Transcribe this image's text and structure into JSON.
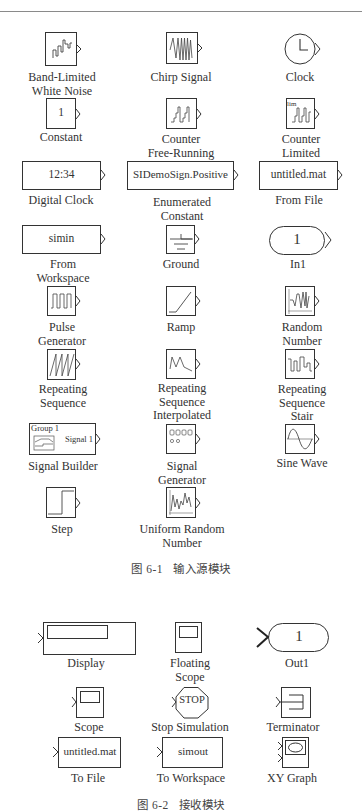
{
  "figure1": {
    "caption_number": "图 6-1",
    "caption_text": "输入源模块",
    "blocks": [
      {
        "name": "Band-Limited White Noise",
        "label": [
          "Band-Limited",
          "White Noise"
        ],
        "icon": "band-limited-noise-icon"
      },
      {
        "name": "Chirp Signal",
        "label": [
          "Chirp Signal"
        ],
        "icon": "chirp-icon"
      },
      {
        "name": "Clock",
        "label": [
          "Clock"
        ],
        "icon": "clock-icon"
      },
      {
        "name": "Constant",
        "label": [
          "Constant"
        ],
        "icon": "constant-icon",
        "value": "1"
      },
      {
        "name": "Counter Free-Running",
        "label": [
          "Counter",
          "Free-Running"
        ],
        "icon": "counter-icon"
      },
      {
        "name": "Counter Limited",
        "label": [
          "Counter",
          "Limited"
        ],
        "icon": "counter-limited-icon",
        "tag": "lim"
      },
      {
        "name": "Digital Clock",
        "label": [
          "Digital Clock"
        ],
        "icon": "digital-clock-icon",
        "value": "12:34"
      },
      {
        "name": "Enumerated Constant",
        "label": [
          "Enumerated",
          "Constant"
        ],
        "icon": "enum-constant-icon",
        "value": "SIDemoSign.Positive"
      },
      {
        "name": "From File",
        "label": [
          "From File"
        ],
        "icon": "from-file-icon",
        "value": "untitled.mat"
      },
      {
        "name": "From Workspace",
        "label": [
          "From",
          "Workspace"
        ],
        "icon": "from-workspace-icon",
        "value": "simin"
      },
      {
        "name": "Ground",
        "label": [
          "Ground"
        ],
        "icon": "ground-icon"
      },
      {
        "name": "In1",
        "label": [
          "In1"
        ],
        "icon": "inport-icon",
        "value": "1"
      },
      {
        "name": "Pulse Generator",
        "label": [
          "Pulse",
          "Generator"
        ],
        "icon": "pulse-icon"
      },
      {
        "name": "Ramp",
        "label": [
          "Ramp"
        ],
        "icon": "ramp-icon"
      },
      {
        "name": "Random Number",
        "label": [
          "Random",
          "Number"
        ],
        "icon": "random-number-icon"
      },
      {
        "name": "Repeating Sequence",
        "label": [
          "Repeating",
          "Sequence"
        ],
        "icon": "sawtooth-icon"
      },
      {
        "name": "Repeating Sequence Interpolated",
        "label": [
          "Repeating",
          "Sequence",
          "Interpolated"
        ],
        "icon": "interpolated-icon"
      },
      {
        "name": "Repeating Sequence Stair",
        "label": [
          "Repeating",
          "Sequence",
          "Stair"
        ],
        "icon": "stair-icon"
      },
      {
        "name": "Signal Builder",
        "label": [
          "Signal Builder"
        ],
        "icon": "signal-builder-icon",
        "group": "Group 1",
        "signal": "Signal 1"
      },
      {
        "name": "Signal Generator",
        "label": [
          "Signal",
          "Generator"
        ],
        "icon": "signal-generator-icon"
      },
      {
        "name": "Sine Wave",
        "label": [
          "Sine Wave"
        ],
        "icon": "sine-icon"
      },
      {
        "name": "Step",
        "label": [
          "Step"
        ],
        "icon": "step-icon"
      },
      {
        "name": "Uniform Random Number",
        "label": [
          "Uniform Random",
          "Number"
        ],
        "icon": "uniform-random-icon"
      }
    ]
  },
  "figure2": {
    "caption_number": "图 6-2",
    "caption_text": "接收模块",
    "blocks": [
      {
        "name": "Display",
        "label": [
          "Display"
        ],
        "icon": "display-icon"
      },
      {
        "name": "Floating Scope",
        "label": [
          "Floating",
          "Scope"
        ],
        "icon": "floating-scope-icon"
      },
      {
        "name": "Out1",
        "label": [
          "Out1"
        ],
        "icon": "outport-icon",
        "value": "1"
      },
      {
        "name": "Scope",
        "label": [
          "Scope"
        ],
        "icon": "scope-icon"
      },
      {
        "name": "Stop Simulation",
        "label": [
          "Stop Simulation"
        ],
        "icon": "stop-icon",
        "value": "STOP"
      },
      {
        "name": "Terminator",
        "label": [
          "Terminator"
        ],
        "icon": "terminator-icon"
      },
      {
        "name": "To File",
        "label": [
          "To File"
        ],
        "icon": "to-file-icon",
        "value": "untitled.mat"
      },
      {
        "name": "To Workspace",
        "label": [
          "To Workspace"
        ],
        "icon": "to-workspace-icon",
        "value": "simout"
      },
      {
        "name": "XY Graph",
        "label": [
          "XY Graph"
        ],
        "icon": "xy-graph-icon"
      }
    ]
  }
}
